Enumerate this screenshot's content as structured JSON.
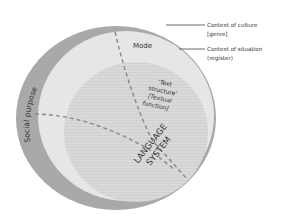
{
  "diagram": {
    "layers": [
      {
        "id": "culture",
        "label": "Social purpose",
        "color": "#a9a9a9"
      },
      {
        "id": "situation",
        "label": "Mode",
        "color": "#e6e6e6"
      },
      {
        "id": "language",
        "label": "LANGUAGE SYSTEM",
        "color": "#d7d7d7"
      }
    ],
    "outer_label": "Social purpose",
    "mode_label": "Mode",
    "text_structure": {
      "line1": "'Text",
      "line2": "structure'",
      "line3": "[Textual",
      "line4": "function]"
    },
    "language_system": {
      "line1": "LANGUAGE",
      "line2": "SYSTEM"
    },
    "callouts": [
      {
        "line1": "Context of culture",
        "line2": "[genre]"
      },
      {
        "line1": "Context of situation",
        "line2": "(register)"
      }
    ],
    "colors": {
      "outer_ring": "#a9a9a9",
      "middle": "#e6e6e6",
      "inner": "#d7d7d7",
      "dash": "#888888",
      "text": "#333333",
      "leader": "#444444"
    }
  }
}
